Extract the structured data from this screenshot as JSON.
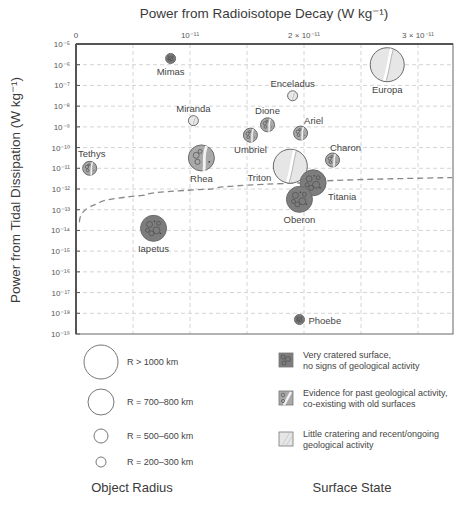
{
  "chart_data": {
    "type": "scatter",
    "title": "Power from Radioisotope Decay (W kg⁻¹)",
    "xlabel": "Power from Radioisotope Decay (W kg⁻¹)",
    "ylabel": "Power from Tidal Dissipation (W kg⁻¹)",
    "x_axis_position": "top",
    "xlim": [
      0,
      3.3e-11
    ],
    "ylim": [
      1e-19,
      1e-05
    ],
    "yscale": "log",
    "grid": true,
    "x_ticks": [
      {
        "value": 0,
        "label": "0"
      },
      {
        "value": 1e-11,
        "label": "10⁻¹¹"
      },
      {
        "value": 2e-11,
        "label": "2 × 10⁻¹¹"
      },
      {
        "value": 3e-11,
        "label": "3 × 10⁻¹¹"
      }
    ],
    "y_ticks": [
      {
        "exp": -5,
        "label": "10⁻⁵"
      },
      {
        "exp": -6,
        "label": "10⁻⁶"
      },
      {
        "exp": -7,
        "label": "10⁻⁷"
      },
      {
        "exp": -8,
        "label": "10⁻⁸"
      },
      {
        "exp": -9,
        "label": "10⁻⁹"
      },
      {
        "exp": -10,
        "label": "10⁻¹⁰"
      },
      {
        "exp": -11,
        "label": "10⁻¹¹"
      },
      {
        "exp": -12,
        "label": "10⁻¹²"
      },
      {
        "exp": -13,
        "label": "10⁻¹³"
      },
      {
        "exp": -14,
        "label": "10⁻¹⁴"
      },
      {
        "exp": -15,
        "label": "10⁻¹⁵"
      },
      {
        "exp": -16,
        "label": "10⁻¹⁶"
      },
      {
        "exp": -17,
        "label": "10⁻¹⁷"
      },
      {
        "exp": -18,
        "label": "10⁻¹⁸"
      },
      {
        "exp": -19,
        "label": "10⁻¹⁹"
      }
    ],
    "points": [
      {
        "name": "Mimas",
        "x": 8.3e-12,
        "log_y": -5.7,
        "size": "R = 200–300 km",
        "surface": "cratered",
        "label_pos": "below"
      },
      {
        "name": "Tethys",
        "x": 1.2e-12,
        "log_y": -11.0,
        "size": "R = 500–600 km",
        "surface": "past",
        "label_pos": "above"
      },
      {
        "name": "Miranda",
        "x": 1.03e-11,
        "log_y": -8.7,
        "size": "R = 200–300 km",
        "surface": "active",
        "label_pos": "above"
      },
      {
        "name": "Rhea",
        "x": 1.1e-11,
        "log_y": -10.5,
        "size": "R = 700–800 km",
        "surface": "past",
        "label_pos": "below"
      },
      {
        "name": "Iapetus",
        "x": 6.8e-12,
        "log_y": -13.9,
        "size": "R = 700–800 km",
        "surface": "cratered",
        "label_pos": "below"
      },
      {
        "name": "Enceladus",
        "x": 1.9e-11,
        "log_y": -7.5,
        "size": "R = 200–300 km",
        "surface": "active",
        "label_pos": "above"
      },
      {
        "name": "Europa",
        "x": 2.73e-11,
        "log_y": -6.0,
        "size": "R > 1000 km",
        "surface": "active",
        "label_pos": "below"
      },
      {
        "name": "Dione",
        "x": 1.68e-11,
        "log_y": -8.9,
        "size": "R = 500–600 km",
        "surface": "past",
        "label_pos": "above"
      },
      {
        "name": "Umbriel",
        "x": 1.53e-11,
        "log_y": -9.4,
        "size": "R = 500–600 km",
        "surface": "past",
        "label_pos": "below"
      },
      {
        "name": "Ariel",
        "x": 1.97e-11,
        "log_y": -9.3,
        "size": "R = 500–600 km",
        "surface": "past",
        "label_pos": "above-right"
      },
      {
        "name": "Charon",
        "x": 2.25e-11,
        "log_y": -10.6,
        "size": "R = 500–600 km",
        "surface": "past",
        "label_pos": "above-right"
      },
      {
        "name": "Triton",
        "x": 1.88e-11,
        "log_y": -10.9,
        "size": "R > 1000 km",
        "surface": "active",
        "label_pos": "below-left"
      },
      {
        "name": "Titania",
        "x": 2.08e-11,
        "log_y": -11.7,
        "size": "R = 700–800 km",
        "surface": "cratered",
        "label_pos": "below-right"
      },
      {
        "name": "Oberon",
        "x": 1.96e-11,
        "log_y": -12.5,
        "size": "R = 700–800 km",
        "surface": "cratered",
        "label_pos": "below"
      },
      {
        "name": "Phoebe",
        "x": 1.96e-11,
        "log_y": -18.3,
        "size": "R = 200–300 km",
        "surface": "cratered",
        "label_pos": "right"
      }
    ],
    "reference_curve": {
      "style": "dashed",
      "description": "Tidal dissipation equal to radioisotope power (y = x)",
      "points_log": [
        [
          3e-13,
          -13.6
        ],
        [
          2e-12,
          -12.7
        ],
        [
          6e-12,
          -12.3
        ],
        [
          1.2e-11,
          -12.0
        ],
        [
          2e-11,
          -11.7
        ],
        [
          3.3e-11,
          -11.45
        ]
      ]
    }
  },
  "legend": {
    "size_title": "Object Radius",
    "size_items": [
      {
        "label": "R > 1000 km",
        "r": 17
      },
      {
        "label": "R = 700–800 km",
        "r": 13
      },
      {
        "label": "R = 500–600 km",
        "r": 7
      },
      {
        "label": "R = 200–300 km",
        "r": 5
      }
    ],
    "surface_title": "Surface State",
    "surface_items": [
      {
        "key": "cratered",
        "line1": "Very cratered surface,",
        "line2": "no signs of geological activity"
      },
      {
        "key": "past",
        "line1": "Evidence for past geological activity,",
        "line2": "co-existing with old surfaces"
      },
      {
        "key": "active",
        "line1": "Little cratering and recent/ongoing",
        "line2": "geological activity"
      }
    ]
  },
  "colors": {
    "cratered": "#7d7d7d",
    "past": "#a9a9a9",
    "active": "#e6e6e6",
    "outline": "#6a6a6a",
    "grid": "#d4d4d4",
    "axis": "#555555"
  }
}
